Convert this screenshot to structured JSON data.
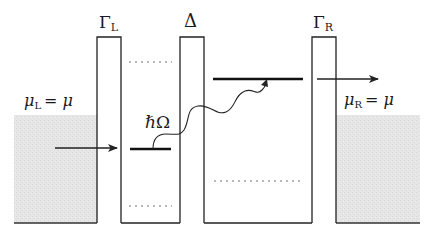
{
  "diagram": {
    "type": "energy-level diagram (double quantum dot with photon-assisted tunneling)",
    "labels": {
      "gamma_left": "Γ",
      "gamma_left_sub": "L",
      "delta": "Δ",
      "gamma_right": "Γ",
      "gamma_right_sub": "R",
      "mu_left_symbol": "μ",
      "mu_left_sub": "L",
      "mu_left_rhs": "= μ",
      "mu_right_symbol": "μ",
      "mu_right_sub": "R",
      "mu_right_rhs": "= μ",
      "photon_hbar": "ℏ",
      "photon_omega": "Ω"
    },
    "elements": {
      "left_reservoir": "shaded lead filled up to μ_L",
      "barrier_left": "tunnel barrier Γ_L",
      "left_dot": "left quantum dot with occupied level (bold) and dotted levels",
      "barrier_center": "interdot barrier Δ",
      "right_dot": "right quantum dot with upper bold level and lower dotted level",
      "barrier_right": "tunnel barrier Γ_R",
      "right_reservoir": "shaded lead filled up to μ_R",
      "arrow_in": "electron tunnels from left lead into left dot",
      "photon_transition": "wavy arrow from left dot level to right dot upper level (photon absorption ℏΩ)",
      "arrow_out": "electron tunnels from right dot into right lead"
    },
    "colors": {
      "line": "#222222",
      "reservoir_fill": "#e4e4e4",
      "dotted_level": "#777777"
    }
  }
}
